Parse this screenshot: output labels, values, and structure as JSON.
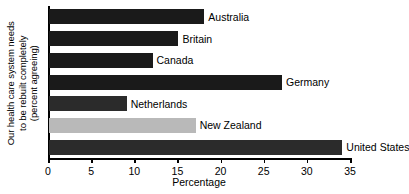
{
  "chart_data": {
    "type": "bar",
    "orientation": "horizontal",
    "title": "",
    "subtitle": "",
    "categories": [
      "Australia",
      "Britain",
      "Canada",
      "Germany",
      "Netherlands",
      "New Zealand",
      "United States"
    ],
    "values": [
      18,
      15,
      12,
      27,
      9,
      17,
      34
    ],
    "xlabel": "Percentage",
    "ylabel": "Our health care system needs to be rebuilt completely (percent agreeing)",
    "ylabel_lines": [
      "Our health care system needs",
      "to be rebuilt completely",
      "(percent agreeing)"
    ],
    "xlim": [
      0,
      35
    ],
    "xticks": [
      0,
      5,
      10,
      15,
      20,
      25,
      30,
      35
    ],
    "xtick_labels": [
      "0",
      "5",
      "10",
      "15",
      "20",
      "25",
      "30",
      "35"
    ],
    "grid": false,
    "legend": false,
    "bar_colors": [
      "#1a1a1a",
      "#1a1a1a",
      "#1a1a1a",
      "#1a1a1a",
      "#2b2b2b",
      "#b9b9b9",
      "#2b2b2b"
    ],
    "bar_label_position": "outside-end",
    "background_color": "#ffffff",
    "axis_color": "#000000",
    "text_color": "#000000"
  }
}
